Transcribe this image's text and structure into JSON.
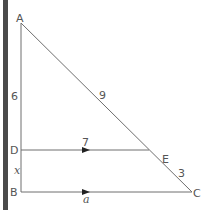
{
  "diagram": {
    "type": "similar-triangles",
    "colors": {
      "line": "#6e6e6e",
      "text": "#555555",
      "left_bar": "#4a4a4a",
      "arrow": "#222222"
    },
    "points": {
      "A": {
        "label": "A",
        "x": 21,
        "y": 23
      },
      "D": {
        "label": "D",
        "x": 21,
        "y": 150
      },
      "B": {
        "label": "B",
        "x": 21,
        "y": 192
      },
      "C": {
        "label": "C",
        "x": 192,
        "y": 192
      },
      "E": {
        "label": "E",
        "x": 149,
        "y": 150
      }
    },
    "segment_labels": {
      "AD": "6",
      "AE": "9",
      "DE": "7",
      "DB": "x",
      "EC": "3",
      "BC": "a"
    },
    "parallel_lines": [
      "DE",
      "BC"
    ]
  }
}
